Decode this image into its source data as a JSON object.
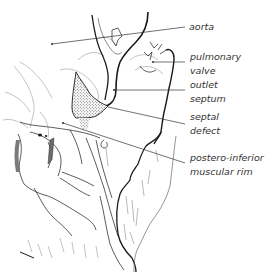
{
  "diagram": {
    "type": "anatomical-line-drawing",
    "colors": {
      "background": "#ffffff",
      "ink": "#1a1a1a",
      "light_ink": "#8a8a8a",
      "label_text": "#333333",
      "stipple": "#555555"
    },
    "labels": [
      {
        "id": "aorta",
        "lines": [
          "aorta"
        ],
        "x": 189,
        "y": 20,
        "pointer": {
          "from": [
            185,
            27
          ],
          "to": [
            52,
            44
          ]
        }
      },
      {
        "id": "pulmonary-valve",
        "lines": [
          "pulmonary",
          "valve"
        ],
        "x": 190,
        "y": 50,
        "pointer": {
          "from": [
            185,
            62
          ],
          "to": [
            153,
            62
          ]
        }
      },
      {
        "id": "outlet-septum",
        "lines": [
          "outlet",
          "septum"
        ],
        "x": 190,
        "y": 78,
        "pointer": {
          "from": [
            185,
            90
          ],
          "to": [
            114,
            90
          ]
        }
      },
      {
        "id": "septal-defect",
        "lines": [
          "septal",
          "defect"
        ],
        "x": 190,
        "y": 110,
        "pointer": {
          "from": [
            185,
            124
          ],
          "to": [
            108,
            107
          ]
        }
      },
      {
        "id": "postero-inferior-muscular-rim",
        "lines": [
          "postero-inferior",
          "muscular rim"
        ],
        "x": 190,
        "y": 151,
        "pointer": {
          "from": [
            185,
            163
          ],
          "to": [
            63,
            123
          ]
        }
      }
    ]
  }
}
